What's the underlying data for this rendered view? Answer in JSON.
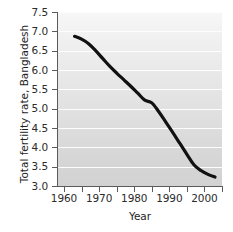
{
  "chart_data": {
    "type": "line",
    "title": "",
    "xlabel": "Year",
    "ylabel": "Total fertility rate, Bangladesh",
    "xlim": [
      1958,
      2005
    ],
    "ylim": [
      3.0,
      7.5
    ],
    "grid": true,
    "legend": null,
    "line_color": "#111111",
    "plot_background": "#e2e2e2",
    "gridline_color": "#fdfdfd",
    "x_ticks": [
      1960,
      1965,
      1970,
      1975,
      1980,
      1985,
      1990,
      1995,
      2000,
      2005
    ],
    "x_tick_labels": [
      "1960",
      "",
      "1970",
      "",
      "1980",
      "",
      "1990",
      "",
      "2000",
      ""
    ],
    "y_ticks": [
      3.0,
      3.5,
      4.0,
      4.5,
      5.0,
      5.5,
      6.0,
      6.5,
      7.0,
      7.5
    ],
    "y_tick_labels": [
      "3.0",
      "3.5",
      "4.0",
      "4.5",
      "5.0",
      "5.5",
      "6.0",
      "6.5",
      "7.0",
      "7.5"
    ],
    "series": [
      {
        "name": "Total fertility rate, Bangladesh",
        "x": [
          1963,
          1965,
          1967,
          1969,
          1971,
          1973,
          1975,
          1977,
          1979,
          1981,
          1983,
          1985,
          1987,
          1989,
          1991,
          1993,
          1995,
          1997,
          1999,
          2001,
          2003
        ],
        "values": [
          6.87,
          6.8,
          6.68,
          6.5,
          6.3,
          6.1,
          5.92,
          5.75,
          5.58,
          5.4,
          5.22,
          5.15,
          4.92,
          4.65,
          4.38,
          4.1,
          3.82,
          3.55,
          3.4,
          3.3,
          3.23
        ]
      }
    ]
  }
}
